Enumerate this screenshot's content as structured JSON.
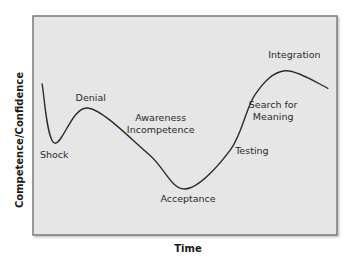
{
  "chart_data": {
    "type": "line",
    "title": "",
    "xlabel": "Time",
    "ylabel": "Competence/Confidence",
    "xlim": [
      0,
      1
    ],
    "ylim": [
      0,
      1
    ],
    "grid": false,
    "legend": null,
    "series": [
      {
        "name": "Change curve",
        "points": [
          {
            "x": 0.03,
            "y": 0.69
          },
          {
            "x": 0.07,
            "y": 0.42
          },
          {
            "x": 0.18,
            "y": 0.58
          },
          {
            "x": 0.38,
            "y": 0.37
          },
          {
            "x": 0.5,
            "y": 0.21
          },
          {
            "x": 0.65,
            "y": 0.39
          },
          {
            "x": 0.73,
            "y": 0.64
          },
          {
            "x": 0.83,
            "y": 0.75
          },
          {
            "x": 0.97,
            "y": 0.67
          }
        ]
      }
    ],
    "annotations": [
      {
        "lines": [
          "Shock"
        ],
        "x": 0.07,
        "y": 0.35
      },
      {
        "lines": [
          "Denial"
        ],
        "x": 0.19,
        "y": 0.61
      },
      {
        "lines": [
          "Awareness",
          "Incompetence"
        ],
        "x": 0.42,
        "y": 0.52
      },
      {
        "lines": [
          "Acceptance"
        ],
        "x": 0.51,
        "y": 0.15
      },
      {
        "lines": [
          "Testing"
        ],
        "x": 0.72,
        "y": 0.37
      },
      {
        "lines": [
          "Search for",
          "Meaning"
        ],
        "x": 0.79,
        "y": 0.58
      },
      {
        "lines": [
          "Integration"
        ],
        "x": 0.86,
        "y": 0.81
      }
    ]
  },
  "colors": {
    "plot_background": "#e6e6e6",
    "frame": "#7a7a7a",
    "curve": "#2b2b2b",
    "text": "#2a2a2a"
  }
}
